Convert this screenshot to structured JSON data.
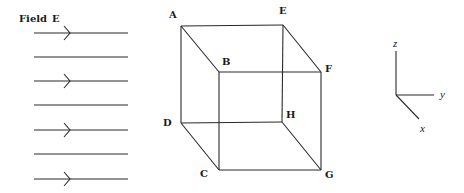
{
  "field": {
    "label": "Field",
    "symbol": "E",
    "lines": [
      {
        "y": 33,
        "arrow": true
      },
      {
        "y": 57,
        "arrow": false
      },
      {
        "y": 81,
        "arrow": true
      },
      {
        "y": 105,
        "arrow": false
      },
      {
        "y": 130,
        "arrow": true
      },
      {
        "y": 154,
        "arrow": false
      },
      {
        "y": 179,
        "arrow": true
      }
    ],
    "x_start": 34,
    "x_end": 128,
    "arrow_x": 70
  },
  "cube": {
    "vertices": {
      "A": [
        181,
        26
      ],
      "E": [
        283,
        25
      ],
      "B": [
        219,
        72
      ],
      "F": [
        321,
        72
      ],
      "D": [
        181,
        123
      ],
      "H": [
        282,
        122
      ],
      "C": [
        219,
        170
      ],
      "G": [
        321,
        170
      ]
    },
    "labels": {
      "A": "A",
      "B": "B",
      "C": "C",
      "D": "D",
      "E": "E",
      "F": "F",
      "G": "G",
      "H": "H"
    },
    "edges": [
      [
        "A",
        "E"
      ],
      [
        "E",
        "F"
      ],
      [
        "F",
        "B"
      ],
      [
        "B",
        "A"
      ],
      [
        "D",
        "H"
      ],
      [
        "H",
        "G"
      ],
      [
        "G",
        "C"
      ],
      [
        "C",
        "D"
      ],
      [
        "A",
        "D"
      ],
      [
        "E",
        "H"
      ],
      [
        "B",
        "C"
      ],
      [
        "F",
        "G"
      ]
    ]
  },
  "axes": {
    "origin": [
      396,
      95
    ],
    "z_end": [
      396,
      51
    ],
    "y_end": [
      434,
      95
    ],
    "x_end": [
      419,
      119
    ],
    "labels": {
      "z": "z",
      "y": "y",
      "x": "x"
    }
  },
  "colors": {
    "ink": "#2a2a2a",
    "background": "#ffffff"
  }
}
